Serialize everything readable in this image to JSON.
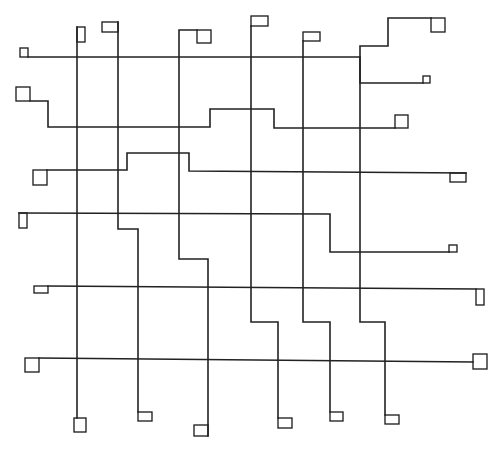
{
  "figure": {
    "kind": "routing-grid",
    "stroke_color": "#222222",
    "stroke_width": 1.6,
    "caption_visible": false,
    "caption_text": ""
  },
  "horizontal_nets": [
    {
      "id": "h1",
      "path": "M28 57 L360 57 L360 83 L423 83",
      "pins": [
        {
          "x": 20,
          "y": 48,
          "w": 8,
          "h": 9
        },
        {
          "x": 423,
          "y": 76,
          "w": 7,
          "h": 7
        }
      ]
    },
    {
      "id": "h2",
      "path": "M30 101 L48 101 L48 127 L210 127 L210 109 L274 109 L274 128 L395 128",
      "pins": [
        {
          "x": 16,
          "y": 87,
          "w": 14,
          "h": 14
        },
        {
          "x": 395,
          "y": 115,
          "w": 13,
          "h": 13
        }
      ]
    },
    {
      "id": "h3",
      "path": "M47 170 L127 170 L127 153 L189 153 L189 171 L466 173",
      "pins": [
        {
          "x": 33,
          "y": 170,
          "w": 14,
          "h": 15
        },
        {
          "x": 450,
          "y": 173,
          "w": 16,
          "h": 9
        }
      ]
    },
    {
      "id": "h4",
      "path": "M19 213 L330 214 L330 252 L449 252",
      "pins": [
        {
          "x": 19,
          "y": 213,
          "w": 8,
          "h": 15
        },
        {
          "x": 449,
          "y": 245,
          "w": 8,
          "h": 7
        }
      ]
    },
    {
      "id": "h5",
      "path": "M48 286 L476 289",
      "pins": [
        {
          "x": 34,
          "y": 286,
          "w": 14,
          "h": 7
        },
        {
          "x": 476,
          "y": 289,
          "w": 8,
          "h": 16
        }
      ]
    },
    {
      "id": "h6",
      "path": "M39 358 L473 362",
      "pins": [
        {
          "x": 25,
          "y": 358,
          "w": 14,
          "h": 14
        },
        {
          "x": 473,
          "y": 354,
          "w": 14,
          "h": 15
        }
      ]
    }
  ],
  "vertical_nets": [
    {
      "id": "v1",
      "path": "M77 27 L77 418",
      "pins": [
        {
          "x": 77,
          "y": 27,
          "w": 8,
          "h": 15
        },
        {
          "x": 74,
          "y": 418,
          "w": 12,
          "h": 14
        }
      ]
    },
    {
      "id": "v2",
      "path": "M118 22 L118 229 L138 229 L138 412",
      "pins": [
        {
          "x": 102,
          "y": 22,
          "w": 16,
          "h": 10
        },
        {
          "x": 138,
          "y": 412,
          "w": 14,
          "h": 9
        }
      ]
    },
    {
      "id": "v3",
      "path": "M197 30 L179 30 L179 259 L208 259 L208 436",
      "pins": [
        {
          "x": 197,
          "y": 30,
          "w": 14,
          "h": 13
        },
        {
          "x": 194,
          "y": 425,
          "w": 14,
          "h": 11
        }
      ]
    },
    {
      "id": "v4",
      "path": "M251 26 L251 322 L278 322 L278 418",
      "pins": [
        {
          "x": 251,
          "y": 16,
          "w": 17,
          "h": 10
        },
        {
          "x": 278,
          "y": 418,
          "w": 14,
          "h": 10
        }
      ]
    },
    {
      "id": "v5",
      "path": "M303 41 L303 322 L330 322 L330 412",
      "pins": [
        {
          "x": 303,
          "y": 32,
          "w": 17,
          "h": 9
        },
        {
          "x": 330,
          "y": 412,
          "w": 13,
          "h": 9
        }
      ]
    },
    {
      "id": "v6",
      "path": "M431 18 L388 18 L388 46 L360 46 L360 322 L385 322 L385 415",
      "pins": [
        {
          "x": 431,
          "y": 18,
          "w": 14,
          "h": 14
        },
        {
          "x": 385,
          "y": 415,
          "w": 14,
          "h": 9
        }
      ]
    }
  ]
}
